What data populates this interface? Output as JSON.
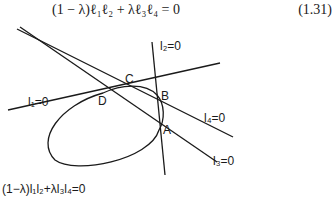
{
  "equation": {
    "text": "(1 − λ)ℓ₁ℓ₂ + λℓ₃ℓ₄ = 0",
    "number": "(1.31)"
  },
  "diagram": {
    "lines": [
      {
        "name": "l1",
        "label": "l₁=0"
      },
      {
        "name": "l2",
        "label": "l₂=0"
      },
      {
        "name": "l3",
        "label": "l₃=0"
      },
      {
        "name": "l4",
        "label": "l₄=0"
      }
    ],
    "points": [
      "A",
      "B",
      "C",
      "D"
    ],
    "conic_label": "(1−λ)l₁l₂+λl₃l₄=0",
    "stroke_color": "#1a1a1a"
  }
}
